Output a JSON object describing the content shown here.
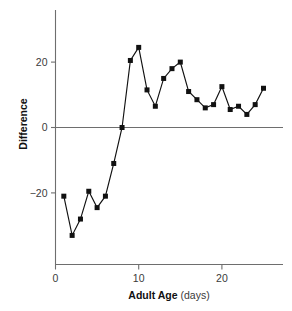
{
  "chart_data": {
    "type": "line",
    "title": "",
    "subtitle": "",
    "xlabel": "Adult Age",
    "xlabel_units": "(days)",
    "ylabel": "Difference",
    "xlim": [
      0,
      26.5
    ],
    "ylim": [
      -36,
      30
    ],
    "xticks": [
      0,
      10,
      20
    ],
    "xticklabels": [
      "0",
      "10",
      "20"
    ],
    "yticks": [
      -20,
      0,
      20
    ],
    "yticklabels": [
      "−20",
      "0",
      "20"
    ],
    "grid": false,
    "legend": "none",
    "zero_reference_line": true,
    "marker": "square",
    "marker_color": "#111111",
    "line_color": "#111111",
    "axis_color": "#6e6e6e",
    "x": [
      1,
      2,
      3,
      4,
      5,
      6,
      7,
      8,
      9,
      10,
      11,
      12,
      13,
      14,
      15,
      16,
      17,
      18,
      19,
      20,
      21,
      22,
      23,
      24,
      25
    ],
    "y": [
      -21,
      -33,
      -28,
      -19.5,
      -24.5,
      -21,
      -11,
      0,
      20.5,
      24.5,
      11.5,
      6.5,
      15,
      18,
      20,
      11,
      8.5,
      6,
      7,
      12.5,
      5.5,
      6.5,
      4,
      7,
      12
    ],
    "series": [
      {
        "name": "Difference",
        "values": [
          -21,
          -33,
          -28,
          -19.5,
          -24.5,
          -21,
          -11,
          0,
          20.5,
          24.5,
          11.5,
          6.5,
          15,
          18,
          20,
          11,
          8.5,
          6,
          7,
          12.5,
          5.5,
          6.5,
          4,
          7,
          12
        ]
      }
    ]
  },
  "figure": {
    "background": "#ffffff"
  }
}
